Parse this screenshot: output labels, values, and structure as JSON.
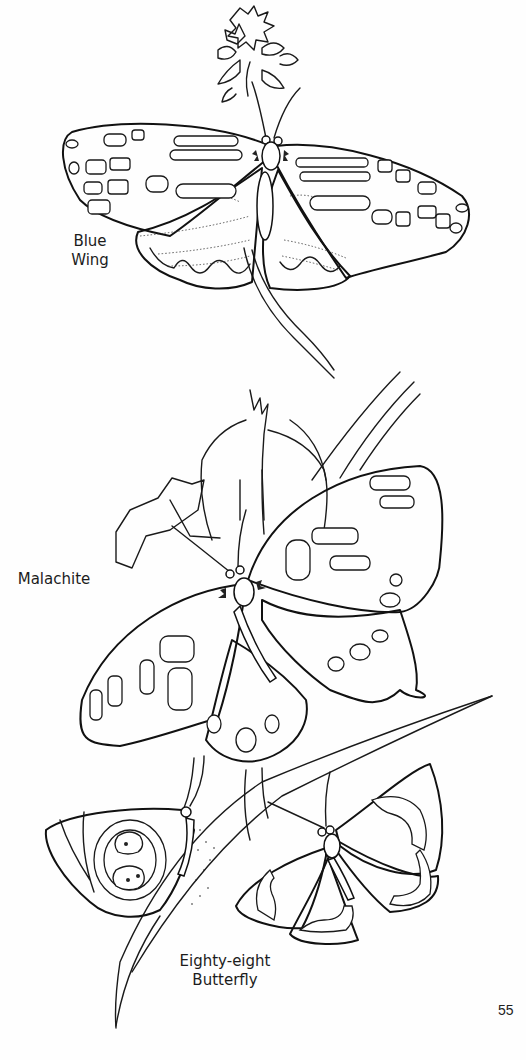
{
  "page": {
    "type": "coloring-book-page",
    "background_color": "#ffffff",
    "line_color": "#1a1a1a",
    "page_number": "55"
  },
  "illustrations": [
    {
      "id": "blue-wing",
      "label_lines": [
        "Blue",
        "Wing"
      ],
      "subject": "butterfly on flower spray, wings spread"
    },
    {
      "id": "malachite",
      "label_lines": [
        "Malachite"
      ],
      "subject": "butterfly on lily flower with leaves"
    },
    {
      "id": "eighty-eight",
      "label_lines": [
        "Eighty-eight",
        "Butterfly"
      ],
      "subject": "two butterflies on a grass leaf"
    }
  ]
}
